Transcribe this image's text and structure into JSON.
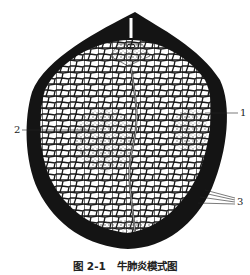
{
  "figure": {
    "caption": "图 2-1   牛肺炎模式图",
    "labels": [
      {
        "id": "1",
        "text": "1"
      },
      {
        "id": "2",
        "text": "2"
      },
      {
        "id": "3",
        "text": "3"
      }
    ],
    "colors": {
      "outline": "#111111",
      "background": "#ffffff",
      "cells": "#1a1a1a",
      "stipple": "#777777"
    }
  }
}
